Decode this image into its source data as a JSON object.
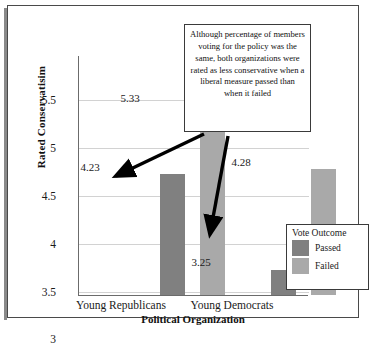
{
  "chart_data": {
    "type": "bar",
    "title": "",
    "xlabel": "Political Organization",
    "ylabel": "Rated Conservatisim",
    "categories": [
      "Young Republicans",
      "Young Democrats"
    ],
    "series": [
      {
        "name": "Passed",
        "values": [
          4.23,
          3.25
        ],
        "color": "#808080"
      },
      {
        "name": "Failed",
        "values": [
          5.33,
          4.28
        ],
        "color": "#a9a9a9"
      }
    ],
    "ylim": [
      3,
      5.5
    ],
    "yticks": [
      "5.5",
      "5",
      "4.5",
      "4",
      "3.5",
      "3"
    ],
    "grid": true,
    "legend_position": "right-bottom",
    "legend_title": "Vote Outcome",
    "data_labels": [
      "4.23",
      "5.33",
      "3.25",
      "4.28"
    ],
    "annotation": "Although percentage of members voting for the policy was the same, both organizations were rated as less conservative when a liberal measure passed than when it failed"
  },
  "axes": {
    "y_title": "Rated Conservatisim",
    "x_title": "Political Organization",
    "y_ticks": [
      {
        "label": "5.5",
        "top": 44
      },
      {
        "label": "5",
        "top": 92
      },
      {
        "label": "4.5",
        "top": 140
      },
      {
        "label": "4",
        "top": 188
      },
      {
        "label": "3.5",
        "top": 236
      },
      {
        "label": "3",
        "top": 283
      }
    ],
    "x_ticks": [
      {
        "label": "Young Republicans",
        "left": 48
      },
      {
        "label": "Young Democrats",
        "left": 159
      }
    ]
  },
  "bars": [
    {
      "name": "passed-young-republicans",
      "series": "Passed",
      "value": "4.23",
      "left": 81,
      "width": 25,
      "height": 121,
      "label_left": 59,
      "label_top": 155
    },
    {
      "name": "failed-young-republicans",
      "series": "Failed",
      "value": "5.33",
      "left": 121,
      "width": 25,
      "height": 190,
      "label_left": 99,
      "label_top": 86
    },
    {
      "name": "passed-young-democrats",
      "series": "Passed",
      "value": "3.25",
      "left": 192,
      "width": 25,
      "height": 25,
      "label_left": 170,
      "label_top": 250
    },
    {
      "name": "failed-young-democrats",
      "series": "Failed",
      "value": "4.28",
      "left": 232,
      "width": 25,
      "height": 126,
      "label_left": 210,
      "label_top": 150
    }
  ],
  "gridlines": [
    44,
    92,
    140,
    188,
    236
  ],
  "callout": {
    "text": "Although percentage of members voting for the policy was the same, both organizations were rated as less conservative when a liberal measure passed than when it failed"
  },
  "legend": {
    "title": "Vote Outcome",
    "items": [
      {
        "label": "Passed",
        "color": "#808080"
      },
      {
        "label": "Failed",
        "color": "#a9a9a9"
      }
    ]
  }
}
